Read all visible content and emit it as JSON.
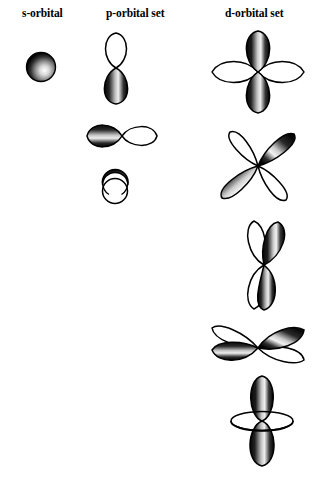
{
  "figure": {
    "background_color": "#ffffff",
    "ink_color": "#000000",
    "columns": [
      {
        "id": "s",
        "label": "s-orbital"
      },
      {
        "id": "p",
        "label": "p-orbital set"
      },
      {
        "id": "d",
        "label": "d-orbital set"
      }
    ]
  },
  "orbitals": {
    "s": [
      {
        "name": "s-sphere",
        "shape": "sphere",
        "lobes": 1,
        "shading": "dark-shaded sphere with light highlight lower-right"
      }
    ],
    "p": [
      {
        "name": "p-vertical",
        "shape": "dumbbell",
        "orientation": "vertical",
        "lobes": 2,
        "shading": "top lobe white outline, bottom lobe dark shaded"
      },
      {
        "name": "p-horizontal",
        "shape": "dumbbell",
        "orientation": "horizontal",
        "lobes": 2,
        "shading": "left lobe dark shaded, right lobe white outline"
      },
      {
        "name": "p-axial",
        "shape": "dumbbell-end-on",
        "orientation": "into-page",
        "lobes": 2,
        "shading": "upper circle dark shaded, lower circle white outline"
      }
    ],
    "d": [
      {
        "name": "d-cloverleaf-upright",
        "shape": "cloverleaf",
        "orientation": "axes-aligned",
        "lobes": 4,
        "shading": "vertical lobes dark shaded, horizontal lobes white outline"
      },
      {
        "name": "d-cloverleaf-diagonal",
        "shape": "cloverleaf",
        "orientation": "diagonal",
        "lobes": 4,
        "shading": "upper-right and lower-left lobes dark shaded, other two white outline"
      },
      {
        "name": "d-cloverleaf-vertical-pair",
        "shape": "cloverleaf",
        "orientation": "steep-vertical",
        "lobes": 4,
        "shading": "front pair dark shaded, rear pair white outline"
      },
      {
        "name": "d-cloverleaf-flattened",
        "shape": "cloverleaf",
        "orientation": "shallow-horizontal",
        "lobes": 4,
        "shading": "lower-left and upper-right lobes dark shaded, other two white outline"
      },
      {
        "name": "d-z-squared",
        "shape": "dumbbell-with-torus",
        "orientation": "vertical",
        "lobes": 2,
        "ring": "white elliptical torus at center",
        "shading": "both lobes dark shaded"
      }
    ]
  }
}
